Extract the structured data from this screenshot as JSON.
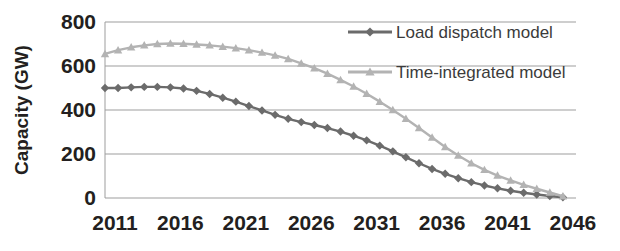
{
  "chart_data": {
    "type": "line",
    "title": "",
    "subtitle": "",
    "xlabel": "",
    "ylabel": "Capacity (GW)",
    "xlim": [
      2011,
      2047
    ],
    "ylim": [
      0,
      800
    ],
    "yticks": [
      0,
      200,
      400,
      600,
      800
    ],
    "xticks": [
      2011,
      2016,
      2021,
      2026,
      2031,
      2036,
      2041,
      2046
    ],
    "xtick_labels": [
      "2011",
      "2016",
      "2021",
      "2026",
      "2031",
      "2036",
      "2041",
      "2046"
    ],
    "ytick_labels": [
      "0",
      "200",
      "400",
      "600",
      "800"
    ],
    "grid": "horizontal",
    "legend_position": "top-right",
    "x": [
      2011,
      2012,
      2013,
      2014,
      2015,
      2016,
      2017,
      2018,
      2019,
      2020,
      2021,
      2022,
      2023,
      2024,
      2025,
      2026,
      2027,
      2028,
      2029,
      2030,
      2031,
      2032,
      2033,
      2034,
      2035,
      2036,
      2037,
      2038,
      2039,
      2040,
      2041,
      2042,
      2043,
      2044,
      2045,
      2046
    ],
    "series": [
      {
        "name": "Load dispatch model",
        "color": "#6b6b6b",
        "marker": "diamond",
        "values": [
          500,
          500,
          503,
          505,
          505,
          503,
          498,
          487,
          473,
          456,
          438,
          418,
          398,
          378,
          360,
          345,
          332,
          318,
          302,
          283,
          262,
          238,
          212,
          185,
          158,
          132,
          110,
          90,
          72,
          57,
          44,
          33,
          24,
          16,
          9,
          3
        ]
      },
      {
        "name": "Time-integrated model",
        "color": "#b3b3b3",
        "marker": "triangle",
        "values": [
          655,
          672,
          685,
          694,
          700,
          702,
          701,
          698,
          694,
          688,
          681,
          672,
          661,
          648,
          632,
          612,
          590,
          565,
          537,
          507,
          474,
          438,
          400,
          360,
          318,
          275,
          232,
          193,
          158,
          128,
          102,
          80,
          60,
          42,
          25,
          8
        ]
      }
    ]
  },
  "legend": {
    "items": [
      {
        "label": "Load dispatch model"
      },
      {
        "label": "Time-integrated model"
      }
    ]
  }
}
